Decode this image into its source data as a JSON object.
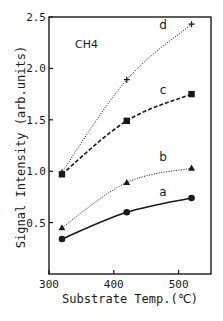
{
  "chart_data": {
    "type": "line",
    "title": "",
    "annotation": "CH4",
    "xlabel": "Substrate Temp.(℃)",
    "ylabel": "Signal Intensity (arb.units)",
    "xlim": [
      300,
      550
    ],
    "ylim": [
      0,
      2.5
    ],
    "xticks": [
      300,
      400,
      500
    ],
    "xtick_labels": [
      "300",
      "400",
      "500"
    ],
    "yticks": [
      0.5,
      1.0,
      1.5,
      2.0,
      2.5
    ],
    "ytick_labels": [
      "0.5",
      "1.0",
      "1.5",
      "2.0",
      "2.5"
    ],
    "grid": false,
    "legend": "inline curve labels at right",
    "x": [
      320,
      420,
      520
    ],
    "series": [
      {
        "name": "a",
        "marker": "circle",
        "line": "solid",
        "values": [
          0.34,
          0.6,
          0.74
        ]
      },
      {
        "name": "b",
        "marker": "triangle",
        "line": "dotted",
        "values": [
          0.45,
          0.89,
          1.03
        ]
      },
      {
        "name": "c",
        "marker": "square",
        "line": "dashed",
        "values": [
          0.97,
          1.49,
          1.75
        ]
      },
      {
        "name": "d",
        "marker": "plus",
        "line": "dotted",
        "values": [
          0.99,
          1.89,
          2.43
        ]
      }
    ],
    "series_label_positions": {
      "a": 0.8,
      "b": 1.14,
      "c": 1.79,
      "d": 2.42
    }
  },
  "colors": {
    "ink": "#1a1a1a",
    "background": "#ffffff"
  }
}
